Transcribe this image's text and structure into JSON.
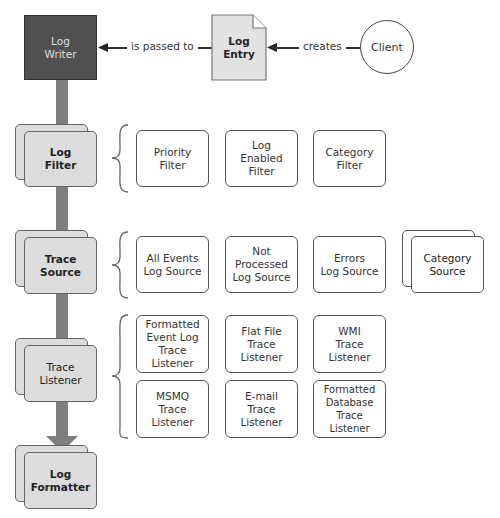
{
  "diagram": {
    "top": {
      "log_writer": "Log\nWriter",
      "log_entry": "Log Entry",
      "client": "Client",
      "edge_passed": "is passed to",
      "edge_creates": "creates"
    },
    "pipeline": [
      {
        "stage": "Log\nFilter",
        "children": [
          "Priority\nFilter",
          "Log\nEnabled\nFilter",
          "Category\nFilter"
        ]
      },
      {
        "stage": "Trace\nSource",
        "children": [
          "All Events\nLog Source",
          "Not Processed\nLog Source",
          "Errors\nLog Source"
        ],
        "extra": "Category\nSource"
      },
      {
        "stage": "Trace\nListener",
        "children": [
          "Formatted\nEvent Log\nTrace Listener",
          "Flat File\nTrace\nListener",
          "WMI\nTrace\nListener",
          "MSMQ\nTrace\nListener",
          "E-mail\nTrace\nListener",
          "Formatted\nDatabase Trace\nListener"
        ]
      },
      {
        "stage": "Log\nFormatter"
      }
    ],
    "colors": {
      "writer_fill": "#505050",
      "stage_fill": "#dcdcdc",
      "spine": "#7e7e7e",
      "stroke": "#555555"
    }
  }
}
